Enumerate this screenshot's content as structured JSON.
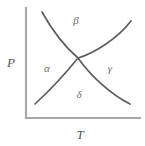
{
  "figure": {
    "kind": "phase-diagram",
    "background_color": "#ffffff",
    "axis_color": "#a8a8a8",
    "curve_color": "#5d5d63",
    "label_color": "#6a6a70"
  },
  "axes": {
    "y_label": "P",
    "x_label": "T",
    "y_axis": {
      "x": 26,
      "y_top": 8,
      "y_bottom": 118
    },
    "x_axis": {
      "y": 118,
      "x_left": 26,
      "x_right": 140
    }
  },
  "invariant_point": {
    "x": 78,
    "y": 58,
    "name": "quadruple-point"
  },
  "regions": [
    {
      "id": "alpha",
      "label": "α",
      "x": 47,
      "y": 72
    },
    {
      "id": "beta",
      "label": "β",
      "x": 76,
      "y": 24
    },
    {
      "id": "gamma",
      "label": "γ",
      "x": 110,
      "y": 72
    },
    {
      "id": "delta",
      "label": "δ",
      "x": 79,
      "y": 98
    }
  ],
  "boundaries": [
    {
      "id": "alpha-beta",
      "from": "alpha",
      "to": "beta",
      "path": "M 42,12 C 52,30 64,46 78,58"
    },
    {
      "id": "beta-gamma",
      "from": "beta",
      "to": "gamma",
      "path": "M 78,58 C 95,53 118,38 131,21"
    },
    {
      "id": "alpha-delta",
      "from": "alpha",
      "to": "delta",
      "path": "M 78,58 C 66,73 48,92 35,104"
    },
    {
      "id": "gamma-delta",
      "from": "gamma",
      "to": "delta",
      "path": "M 78,58 C 90,75 110,94 130,104"
    }
  ]
}
